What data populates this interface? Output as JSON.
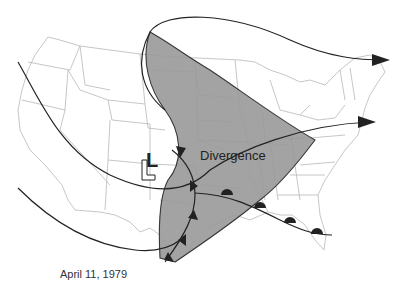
{
  "map": {
    "title": "Upper-level flow and divergence over the United States",
    "date_caption": "April 11, 1979",
    "region_label": "Divergence",
    "low_symbol": "L",
    "colors": {
      "divergence_fill": "#9a9a9a",
      "state_borders": "#b8b8b8",
      "flow_lines": "#222222",
      "background": "#ffffff"
    },
    "features": [
      {
        "type": "shaded-region",
        "label": "Divergence"
      },
      {
        "type": "low-pressure-center",
        "label": "L"
      },
      {
        "type": "cold-front"
      },
      {
        "type": "warm-front"
      },
      {
        "type": "flow-arrow",
        "direction": "east"
      },
      {
        "type": "flow-arrow",
        "direction": "east"
      }
    ]
  }
}
